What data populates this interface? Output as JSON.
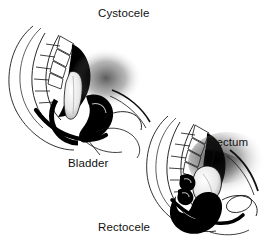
{
  "figure": {
    "title": "Cystocele",
    "alt_description": "Two black and white mid-sagittal medical line drawings of the female pelvis. The upper left drawing shows a cystocele with the bladder bulging. The lower right drawing shows a rectocele with the rectum bulging.",
    "background_color": "#ffffff",
    "ink_color": "#000000",
    "shading_color": "#3a3a3a",
    "labels": [
      {
        "id": "cystocele",
        "text": "Cystocele",
        "x": 98,
        "y": 7
      },
      {
        "id": "bladder",
        "text": "Bladder",
        "x": 68,
        "y": 157
      },
      {
        "id": "rectum",
        "text": "Rectum",
        "x": 208,
        "y": 136
      },
      {
        "id": "rectocele",
        "text": "Rectocele",
        "x": 98,
        "y": 221
      }
    ],
    "panels": [
      {
        "id": "upper-left-panel",
        "condition": "Cystocele",
        "organ_labelled": "Bladder",
        "position": "upper-left"
      },
      {
        "id": "lower-right-panel",
        "condition": "Rectocele",
        "organ_labelled": "Rectum",
        "position": "lower-right"
      }
    ],
    "leader_lines": [
      {
        "id": "bladder-leader",
        "from_x": 100,
        "from_y": 155,
        "to_x": 88,
        "to_y": 140
      },
      {
        "id": "rectum-leader",
        "from_x": 215,
        "from_y": 150,
        "to_x": 211,
        "to_y": 167
      }
    ]
  }
}
